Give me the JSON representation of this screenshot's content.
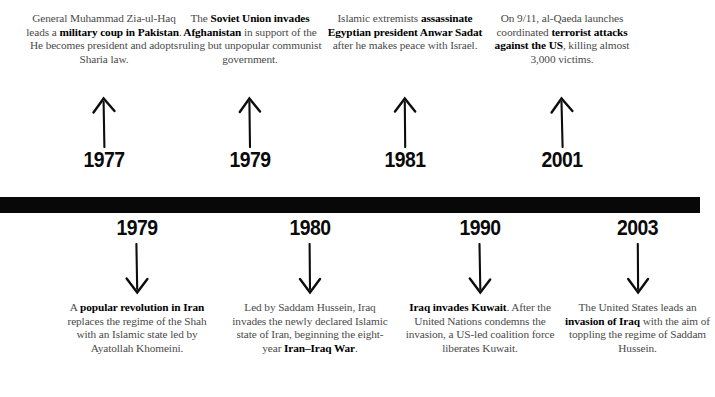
{
  "page": {
    "background_color": "#ffffff",
    "bar_color": "#080808",
    "body_text_color": "#4a4a4a",
    "highlight_text_color": "#000000"
  },
  "timeline": {
    "bar_label": "",
    "above_events": [
      {
        "year": "1977",
        "arrow": "up-arrow",
        "text_html": "General Muhammad Zia-ul-Haq leads a <b>military coup in Pakistan</b>. He becomes president and adopts Sharia law.",
        "text_plain": "General Muhammad Zia-ul-Haq leads a military coup in Pakistan. He becomes president and adopts Sharia law.",
        "bold_phrases": [
          "military coup in Pakistan"
        ]
      },
      {
        "year": "1979",
        "arrow": "up-arrow",
        "text_html": "The <b>Soviet Union invades Afghanistan</b> in support of the ruling but unpopular communist government.",
        "text_plain": "The Soviet Union invades Afghanistan in support of the ruling but unpopular communist government.",
        "bold_phrases": [
          "Soviet Union invades Afghanistan"
        ]
      },
      {
        "year": "1981",
        "arrow": "up-arrow",
        "text_html": "Islamic extremists <b>assassinate Egyptian president Anwar Sadat</b> after he makes peace with Israel.",
        "text_plain": "Islamic extremists assassinate Egyptian president Anwar Sadat after he makes peace with Israel.",
        "bold_phrases": [
          "assassinate Egyptian president Anwar Sadat"
        ]
      },
      {
        "year": "2001",
        "arrow": "up-arrow",
        "text_html": "On 9/11, al-Qaeda launches coordinated <b>terrorist attacks against the US</b>, killing almost 3,000 victims.",
        "text_plain": "On 9/11, al-Qaeda launches coordinated terrorist attacks against the US, killing almost 3,000 victims.",
        "bold_phrases": [
          "terrorist attacks against the US"
        ]
      }
    ],
    "below_events": [
      {
        "year": "1979",
        "arrow": "down-arrow",
        "text_html": "A <b>popular revolution in Iran</b> replaces the regime of the Shah with an Islamic state led by Ayatollah Khomeini.",
        "text_plain": "A popular revolution in Iran replaces the regime of the Shah with an Islamic state led by Ayatollah Khomeini.",
        "bold_phrases": [
          "popular revolution in Iran"
        ]
      },
      {
        "year": "1980",
        "arrow": "down-arrow",
        "text_html": "Led by Saddam Hussein, Iraq invades the newly declared Islamic state of Iran, beginning the eight-year <b>Iran&#8211;Iraq War</b>.",
        "text_plain": "Led by Saddam Hussein, Iraq invades the newly declared Islamic state of Iran, beginning the eight-year Iran–Iraq War.",
        "bold_phrases": [
          "Iran–Iraq War"
        ]
      },
      {
        "year": "1990",
        "arrow": "down-arrow",
        "text_html": "<b>Iraq invades Kuwait</b>. After the United Nations condemns the invasion, a US-led coalition force liberates Kuwait.",
        "text_plain": "Iraq invades Kuwait. After the United Nations condemns the invasion, a US-led coalition force liberates Kuwait.",
        "bold_phrases": [
          "Iraq invades Kuwait"
        ]
      },
      {
        "year": "2003",
        "arrow": "down-arrow",
        "text_html": "The United States leads an <b>invasion of Iraq</b> with the aim of toppling the regime of Saddam Hussein.",
        "text_plain": "The United States leads an invasion of Iraq with the aim of toppling the regime of Saddam Hussein.",
        "bold_phrases": [
          "invasion of Iraq"
        ]
      }
    ]
  }
}
